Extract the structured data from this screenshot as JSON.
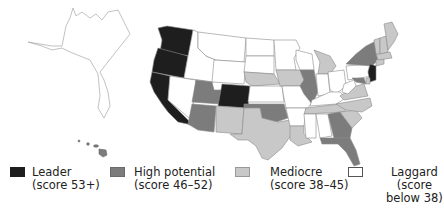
{
  "map": {
    "title": "",
    "colors": {
      "leader": "#1e1e1e",
      "high_potential": "#7c7c7c",
      "mediocre": "#c8c8c8",
      "laggard": "#ffffff",
      "border": "#8a8a8a"
    },
    "states": {
      "leader": [
        "WA",
        "OR",
        "CA",
        "CO",
        "NJ"
      ],
      "high_potential": [
        "AZ",
        "UT",
        "OK",
        "IL",
        "GA",
        "FL",
        "NY",
        "MD",
        "HI"
      ],
      "mediocre": [
        "NM",
        "TX",
        "NE",
        "MN",
        "LA",
        "MI",
        "TN",
        "NC",
        "VA",
        "ME",
        "NH",
        "VT",
        "MA",
        "CT",
        "RI",
        "DE"
      ],
      "laggard": [
        "AK",
        "NV",
        "ID",
        "MT",
        "WY",
        "ND",
        "SD",
        "KS",
        "IA",
        "MO",
        "AR",
        "MS",
        "AL",
        "WI",
        "IN",
        "OH",
        "KY",
        "WV",
        "PA",
        "SC"
      ]
    }
  },
  "legend": {
    "items": [
      {
        "label_line1": "Leader",
        "label_line2": "(score 53+)",
        "label_line3": "",
        "color": "#1e1e1e"
      },
      {
        "label_line1": "High potential",
        "label_line2": "(score 46–52)",
        "label_line3": "",
        "color": "#7c7c7c"
      },
      {
        "label_line1": "Mediocre",
        "label_line2": "(score 38–45)",
        "label_line3": "",
        "color": "#c8c8c8"
      },
      {
        "label_line1": "Laggard",
        "label_line2": "(score",
        "label_line3": "below 38)",
        "color": "#ffffff"
      }
    ]
  }
}
